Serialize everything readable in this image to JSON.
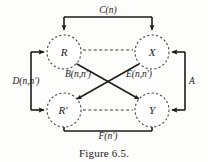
{
  "figure": {
    "caption": "Figure 6.5.",
    "nodes": [
      {
        "id": "R",
        "label": "R",
        "cx": 64,
        "cy": 52,
        "r": 17
      },
      {
        "id": "X",
        "label": "X",
        "cx": 152,
        "cy": 52,
        "r": 17
      },
      {
        "id": "Rp",
        "label": "R'",
        "cx": 64,
        "cy": 110,
        "r": 17
      },
      {
        "id": "Y",
        "label": "Y",
        "cx": 152,
        "cy": 110,
        "r": 17
      }
    ],
    "edge_labels": {
      "top": "C(n)",
      "left": "D(n,n')",
      "right": "A",
      "bottom": "F(n')",
      "diagonal_left": "B(n,n')",
      "diagonal_right": "E(n,n')"
    },
    "colors": {
      "ink": "#1b1b1b",
      "node_stroke": "#4a4a4a",
      "dashed": "#3a3a3a",
      "background": "#fdfdfb"
    }
  }
}
